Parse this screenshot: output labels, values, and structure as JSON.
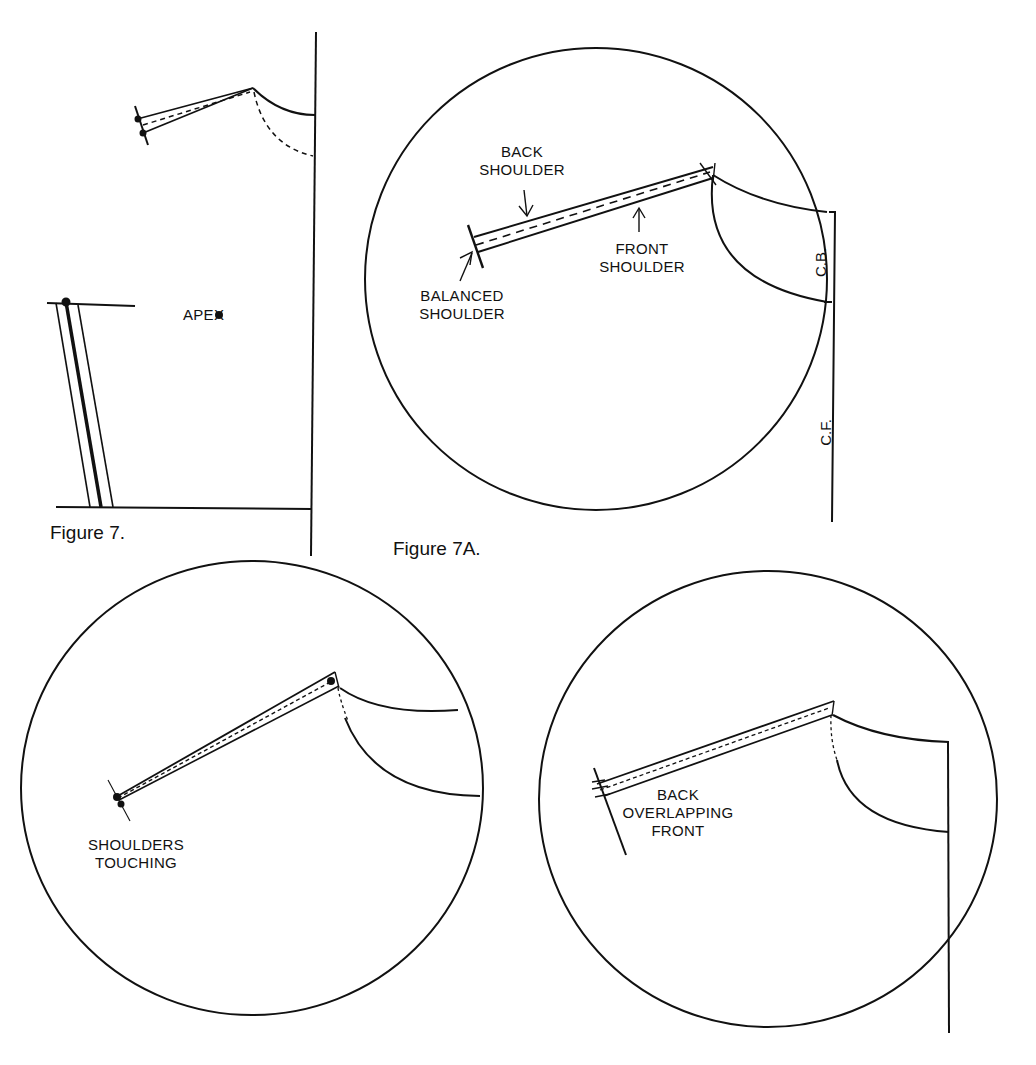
{
  "figure7": {
    "caption": "Figure 7.",
    "labels": {
      "apex": "APEX"
    }
  },
  "figure7a": {
    "caption": "Figure 7A.",
    "labels": {
      "back_shoulder": "BACK SHOULDER",
      "front_shoulder": "FRONT SHOULDER",
      "balanced_shoulder": "BALANCED SHOULDER",
      "cb": "C.B.",
      "cf": "C.F."
    }
  },
  "detail_touching": {
    "labels": {
      "shoulders_touching": "SHOULDERS TOUCHING"
    }
  },
  "detail_overlapping": {
    "labels": {
      "back_overlapping_front": "BACK OVERLAPPING FRONT"
    }
  },
  "colors": {
    "ink": "#111111",
    "paper": "#ffffff"
  }
}
